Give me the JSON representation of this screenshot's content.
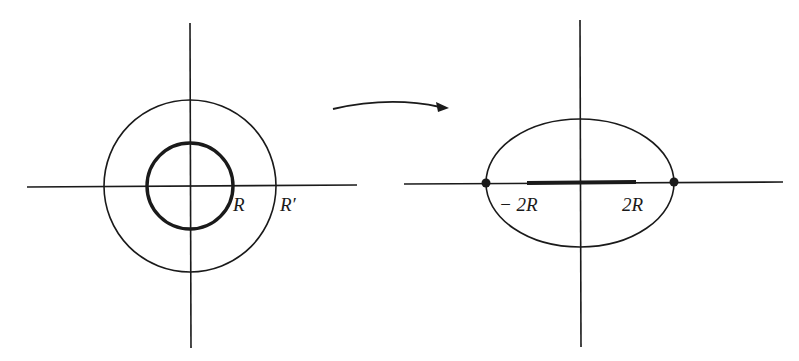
{
  "diagram": {
    "colors": {
      "ink": "#1a1a1a",
      "background": "#ffffff"
    },
    "left_panel": {
      "inner_circle_label": "R",
      "outer_circle_label": "R′"
    },
    "arrow": {
      "meaning": "maps-to"
    },
    "right_panel": {
      "left_endpoint_label": "− 2R",
      "right_endpoint_label": "2R"
    }
  }
}
